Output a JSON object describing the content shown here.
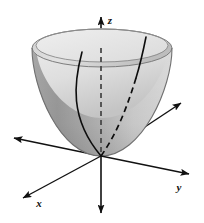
{
  "figure": {
    "kind": "3d-surface-diagram",
    "background_color": "#ffffff",
    "ink_color": "#111111"
  },
  "axes": [
    {
      "id": "x",
      "label": "x",
      "label_x": 39,
      "label_y": 207,
      "positive_direction": "lower-left",
      "line": {
        "x1": 181,
        "y1": 103,
        "x2": 22,
        "y2": 199
      },
      "arrow_positive": {
        "x": 22,
        "y": 199,
        "angle_deg": 149
      },
      "arrow_negative": {
        "x": 181,
        "y": 103,
        "angle_deg": -31
      }
    },
    {
      "id": "y",
      "label": "y",
      "label_x": 179,
      "label_y": 191,
      "positive_direction": "lower-right",
      "line": {
        "x1": 13,
        "y1": 139,
        "x2": 190,
        "y2": 175
      },
      "arrow_positive": {
        "x": 190,
        "y": 175,
        "angle_deg": 11.5
      },
      "arrow_negative": {
        "x": 13,
        "y": 139,
        "angle_deg": -168.5
      }
    },
    {
      "id": "z",
      "label": "z",
      "label_x": 110,
      "label_y": 24,
      "positive_direction": "up",
      "line": {
        "x1": 101,
        "y1": 16,
        "x2": 101,
        "y2": 214
      },
      "arrow_positive": {
        "x": 101,
        "y": 16,
        "angle_deg": -90
      },
      "arrow_negative": {
        "x": 101,
        "y": 214,
        "angle_deg": 90
      }
    }
  ],
  "surface": {
    "name": "elliptic-paraboloid",
    "equation_implied": "z = x^2 + y^2",
    "vertex": {
      "x": 101,
      "y": 156
    },
    "rim": {
      "center_x": 102,
      "center_y": 48,
      "radius_x": 70,
      "radius_y": 19
    },
    "outer_fill_light": "#d8d8d8",
    "outer_fill_dark": "#9a9a9a",
    "inner_fill_light": "#e8e8e8",
    "inner_fill_dark": "#c2c2c2",
    "rim_band_color": "#b4b4b4",
    "outline_color": "#6f6f6f"
  },
  "trace_curves": [
    {
      "id": "front-left-parabola",
      "style": "solid",
      "description": "visible parabola trace on near side of bowl, left branch",
      "path": "M 82 52 C 74 82 69 118 101 156"
    },
    {
      "id": "back-right-parabola-upper",
      "style": "solid",
      "description": "parabola trace visible on inner wall above rim line, right branch",
      "path": "M 146 37 C 143 52 140 64 136 78"
    },
    {
      "id": "back-right-parabola-hidden",
      "style": "dashed",
      "description": "hidden continuation of right parabola branch behind the surface",
      "path": "M 136 78 C 128 104 118 132 101 156"
    },
    {
      "id": "z-axis-hidden-segment",
      "style": "dashed",
      "description": "portion of z axis hidden inside the bowl between rim and vertex",
      "path": "M 101 48 L 101 156"
    }
  ]
}
